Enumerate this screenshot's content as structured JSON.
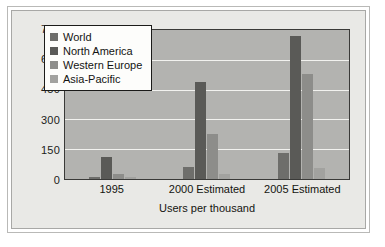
{
  "chart_data": {
    "type": "bar",
    "title": "",
    "xlabel": "Users per thousand",
    "ylabel": "",
    "categories": [
      "1995",
      "2000 Estimated",
      "2005 Estimated"
    ],
    "series": [
      {
        "name": "World",
        "values": [
          10,
          60,
          130
        ],
        "color": "#6e6e6b"
      },
      {
        "name": "North America",
        "values": [
          110,
          490,
          720
        ],
        "color": "#5a5a57"
      },
      {
        "name": "Western Europe",
        "values": [
          25,
          225,
          530
        ],
        "color": "#8d8d8a"
      },
      {
        "name": "Asia-Pacific",
        "values": [
          8,
          25,
          55
        ],
        "color": "#a2a29f"
      }
    ],
    "ylim": [
      0,
      750
    ],
    "yticks": [
      0,
      150,
      300,
      450,
      600,
      750
    ],
    "ytick_labels": [
      "0",
      "150",
      "300",
      "450",
      "600",
      "750"
    ],
    "grid": true,
    "legend_position": "upper left",
    "plot_background": "#b3b3b0",
    "gridline_color": "#f2f2ef",
    "figure_background": "#e9e9e6"
  }
}
